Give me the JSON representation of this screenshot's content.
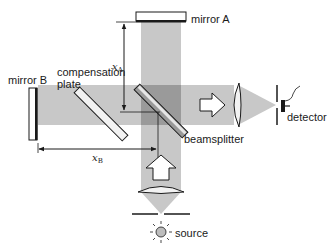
{
  "labels": {
    "mirror_a": "mirror A",
    "mirror_b": "mirror B",
    "compensation_plate_line1": "compensation",
    "compensation_plate_line2": "plate",
    "beamsplitter": "beamsplitter",
    "detector": "detector",
    "source": "source",
    "xa_var": "x",
    "xa_sub": "A",
    "xb_var": "x",
    "xb_sub": "B"
  },
  "colors": {
    "beam": "#c8c8c8",
    "beam_overlap": "#9a9a9a",
    "plate_fill": "#f2f2f2",
    "stroke": "#1a1a1a",
    "source_fill": "#bdbdbd"
  },
  "components": [
    {
      "id": "mirror-a",
      "label": "mirror A"
    },
    {
      "id": "mirror-b",
      "label": "mirror B"
    },
    {
      "id": "compensation-plate",
      "label": "compensation plate"
    },
    {
      "id": "beamsplitter",
      "label": "beamsplitter"
    },
    {
      "id": "detector-lens",
      "label": ""
    },
    {
      "id": "source-lens",
      "label": ""
    },
    {
      "id": "detector",
      "label": "detector"
    },
    {
      "id": "source",
      "label": "source"
    }
  ],
  "dimensions": [
    {
      "id": "x-a",
      "label": "xA",
      "orientation": "vertical"
    },
    {
      "id": "x-b",
      "label": "xB",
      "orientation": "horizontal"
    }
  ]
}
